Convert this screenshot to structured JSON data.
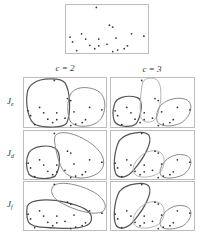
{
  "figure": {
    "column_labels": [
      "c = 2",
      "c = 3"
    ],
    "row_labels": [
      {
        "main": "J",
        "sub": "e"
      },
      {
        "main": "J",
        "sub": "d"
      },
      {
        "main": "J",
        "sub": "f"
      }
    ]
  },
  "colors": {
    "frame": "#bdbdbd",
    "dot": "#333333",
    "cluster_dark": "#555555",
    "cluster_mid": "#8a8a8a",
    "cluster_light": "#b5b5b5"
  },
  "points": [
    [
      0.37,
      0.05
    ],
    [
      0.53,
      0.42
    ],
    [
      0.57,
      0.46
    ],
    [
      0.05,
      0.67
    ],
    [
      0.08,
      0.77
    ],
    [
      0.19,
      0.6
    ],
    [
      0.24,
      0.71
    ],
    [
      0.13,
      0.95
    ],
    [
      0.29,
      0.84
    ],
    [
      0.35,
      0.91
    ],
    [
      0.4,
      0.71
    ],
    [
      0.4,
      0.85
    ],
    [
      0.5,
      0.82
    ],
    [
      0.61,
      0.69
    ],
    [
      0.57,
      0.97
    ],
    [
      0.63,
      0.94
    ],
    [
      0.71,
      0.91
    ],
    [
      0.75,
      0.85
    ],
    [
      0.8,
      0.6
    ],
    [
      0.95,
      0.65
    ]
  ]
}
